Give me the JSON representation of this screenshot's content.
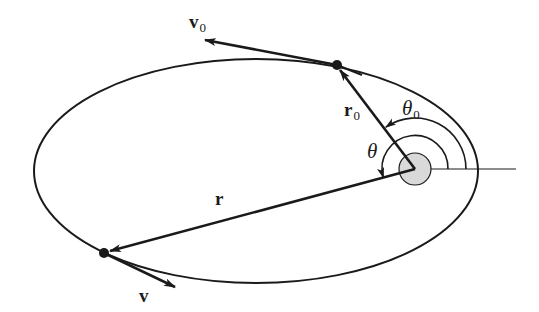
{
  "figure": {
    "colors": {
      "stroke": "#1a1a1a",
      "focus_fill": "#d9d9d9",
      "background": "#ffffff"
    },
    "orbit": {
      "cx": 256,
      "cy": 171,
      "rx": 222,
      "ry": 112
    },
    "focus": {
      "x": 415,
      "y": 169,
      "r": 16
    },
    "reference_line": {
      "x1": 415,
      "y1": 169,
      "x2": 516,
      "y2": 169
    },
    "points": {
      "p0": {
        "x": 337,
        "y": 65
      },
      "p": {
        "x": 104,
        "y": 253
      }
    },
    "vectors": {
      "r0": {
        "label": "r",
        "subscript": "0",
        "from": [
          415,
          169
        ],
        "to": [
          337,
          65
        ]
      },
      "r": {
        "label": "r",
        "from": [
          415,
          169
        ],
        "to": [
          104,
          253
        ]
      },
      "v0": {
        "label": "v",
        "subscript": "0",
        "from": [
          337,
          65
        ],
        "to": [
          205,
          40
        ]
      },
      "v": {
        "label": "v",
        "from": [
          104,
          253
        ],
        "to": [
          175,
          287
        ]
      }
    },
    "angles": {
      "theta0": {
        "label": "θ",
        "subscript": "0",
        "radius": 51
      },
      "theta": {
        "label": "θ",
        "radius": 33
      }
    }
  }
}
